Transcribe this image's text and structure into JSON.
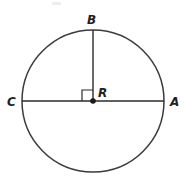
{
  "figure": {
    "background_color": "#ffffff",
    "stroke_color": "#3b3b3b",
    "line_color": "#2b2b2b",
    "label_color": "#231f20",
    "labels": {
      "top": "B",
      "left": "C",
      "center": "R",
      "right": "A"
    },
    "geometry": {
      "center_x": 93,
      "center_y": 101,
      "radius": 71,
      "diameter_left_x": 22,
      "diameter_right_x": 164,
      "radius_top_y": 30,
      "right_angle_size": 11
    },
    "label_positions": {
      "top": {
        "x": 87,
        "y": 24
      },
      "left": {
        "x": 7,
        "y": 106
      },
      "center": {
        "x": 98,
        "y": 97
      },
      "right": {
        "x": 170,
        "y": 106
      }
    }
  }
}
